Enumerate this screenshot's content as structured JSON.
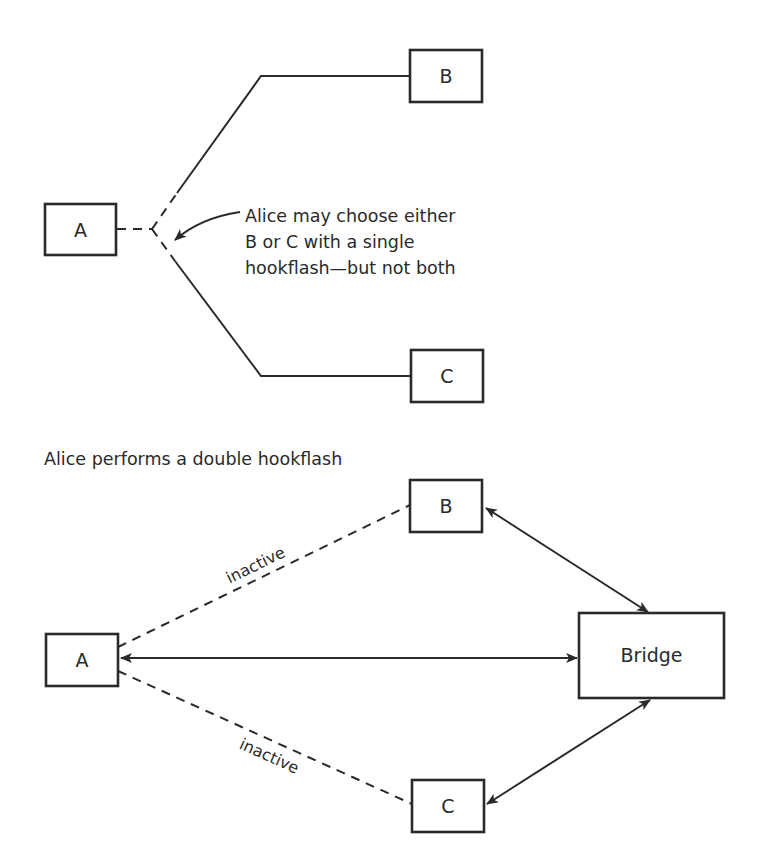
{
  "top_diagram": {
    "nodes": {
      "a": {
        "label": "A"
      },
      "b": {
        "label": "B"
      },
      "c": {
        "label": "C"
      }
    },
    "annotation": {
      "lines": [
        "Alice may choose either",
        "B or C with a single",
        "hookflash—but not both"
      ]
    }
  },
  "bottom_diagram": {
    "title": "Alice performs a double hookflash",
    "nodes": {
      "a": {
        "label": "A"
      },
      "b": {
        "label": "B"
      },
      "c": {
        "label": "C"
      },
      "bridge": {
        "label": "Bridge"
      }
    },
    "edges": {
      "a_b": {
        "label": "inactive",
        "style": "dashed"
      },
      "a_c": {
        "label": "inactive",
        "style": "dashed"
      },
      "a_bridge": {
        "style": "solid-bidirectional"
      },
      "b_bridge": {
        "style": "solid-bidirectional"
      },
      "c_bridge": {
        "style": "solid-bidirectional"
      }
    }
  },
  "colors": {
    "stroke": "#2a2a2a",
    "background": "#ffffff"
  }
}
